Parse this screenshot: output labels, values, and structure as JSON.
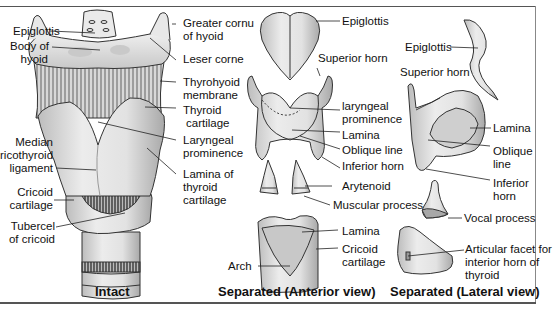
{
  "figure": {
    "panels": [
      {
        "caption": "Intact",
        "labels": {
          "epiglottis": "Epiglottis",
          "body_of_hyoid_1": "Body of",
          "body_of_hyoid_2": "hyoid",
          "greater_cornu_1": "Greater cornu",
          "greater_cornu_2": "of hyoid",
          "lesser_corne": "Leser corne",
          "thyrohyoid_1": "Thyrohyoid",
          "thyrohyoid_2": "membrane",
          "thyroid_cart_1": "Thyroid",
          "thyroid_cart_2": "cartilage",
          "laryngeal_prom_1": "Laryngeal",
          "laryngeal_prom_2": "prominence",
          "lamina_thyroid_1": "Lamina of",
          "lamina_thyroid_2": "thyroid",
          "lamina_thyroid_3": "cartilage",
          "median_crico_1": "Median",
          "median_crico_2": "ricothyroid",
          "median_crico_3": "ligament",
          "cricoid_1": "Cricoid",
          "cricoid_2": "cartilage",
          "tubercel_1": "Tubercel",
          "tubercel_2": "of cricoid"
        }
      },
      {
        "caption": "Separated (Anterior view)",
        "labels": {
          "epiglottis": "Epiglottis",
          "superior_horn": "Superior horn",
          "laryngeal_prom_1": "laryngeal",
          "laryngeal_prom_2": "prominence",
          "lamina": "Lamina",
          "oblique_line": "Oblique line",
          "inferior_horn": "Inferior horn",
          "arytenoid": "Arytenoid",
          "muscular_process": "Muscular process",
          "cricoid_lamina": "Lamina",
          "cricoid_1": "Cricoid",
          "cricoid_2": "cartilage",
          "arch": "Arch"
        }
      },
      {
        "caption": "Separated (Lateral view)",
        "labels": {
          "epiglottis": "Epiglottis",
          "superior_horn": "Superior horn",
          "lamina": "Lamina",
          "oblique_1": "Oblique",
          "oblique_2": "line",
          "inferior_1": "Inferior",
          "inferior_2": "horn",
          "vocal_process": "Vocal process",
          "articular_1": "Articular facet for",
          "articular_2": "interior horn of",
          "articular_3": "thyroid"
        }
      }
    ],
    "colors": {
      "cartilage_fill": "#e4e4e4",
      "shadow": "#b8b8b8",
      "outline": "#333333",
      "text": "#111111"
    }
  }
}
